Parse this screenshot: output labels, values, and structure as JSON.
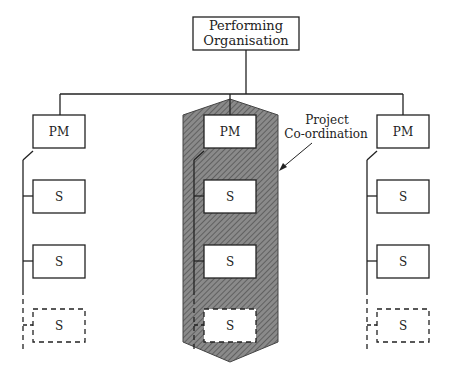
{
  "root": {
    "line1": "Performing",
    "line2": "Organisation"
  },
  "annotation": {
    "line1": "Project",
    "line2": "Co-ordination"
  },
  "columns": [
    {
      "x": 33,
      "spine": 23,
      "boxes": [
        "PM",
        "S",
        "S",
        "S"
      ]
    },
    {
      "x": 204,
      "spine": 194,
      "boxes": [
        "PM",
        "S",
        "S",
        "S"
      ]
    },
    {
      "x": 377,
      "spine": 367,
      "boxes": [
        "PM",
        "S",
        "S",
        "S"
      ]
    }
  ],
  "colors": {
    "line": "#222222",
    "shade": "#7a7a7a",
    "hatch": "#555555"
  }
}
